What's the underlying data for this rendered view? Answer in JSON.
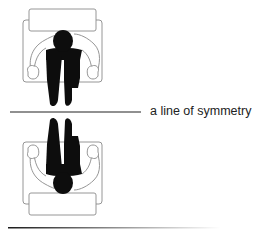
{
  "diagram": {
    "symmetry_label": "a line of symmetry",
    "figures": [
      {
        "name": "seated-person-top-view",
        "orientation": "upright"
      },
      {
        "name": "seated-person-top-view-mirrored",
        "orientation": "mirrored"
      }
    ],
    "colors": {
      "outline": "#8a8a8a",
      "figure_fill": "#0d0d0d",
      "line": "#222222",
      "text": "#222222",
      "background": "#ffffff"
    }
  }
}
